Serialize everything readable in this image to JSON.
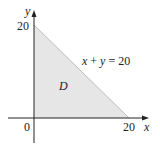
{
  "diagram": {
    "x_axis_label": "x",
    "y_axis_label": "y",
    "origin_label": "0",
    "x_intercept_label": "20",
    "y_intercept_label": "20",
    "line_equation": "x + y = 20",
    "region_label": "D",
    "region_fill": "#e6e6e6",
    "line_color": "#bdbdbd",
    "axis_color": "#222222"
  }
}
